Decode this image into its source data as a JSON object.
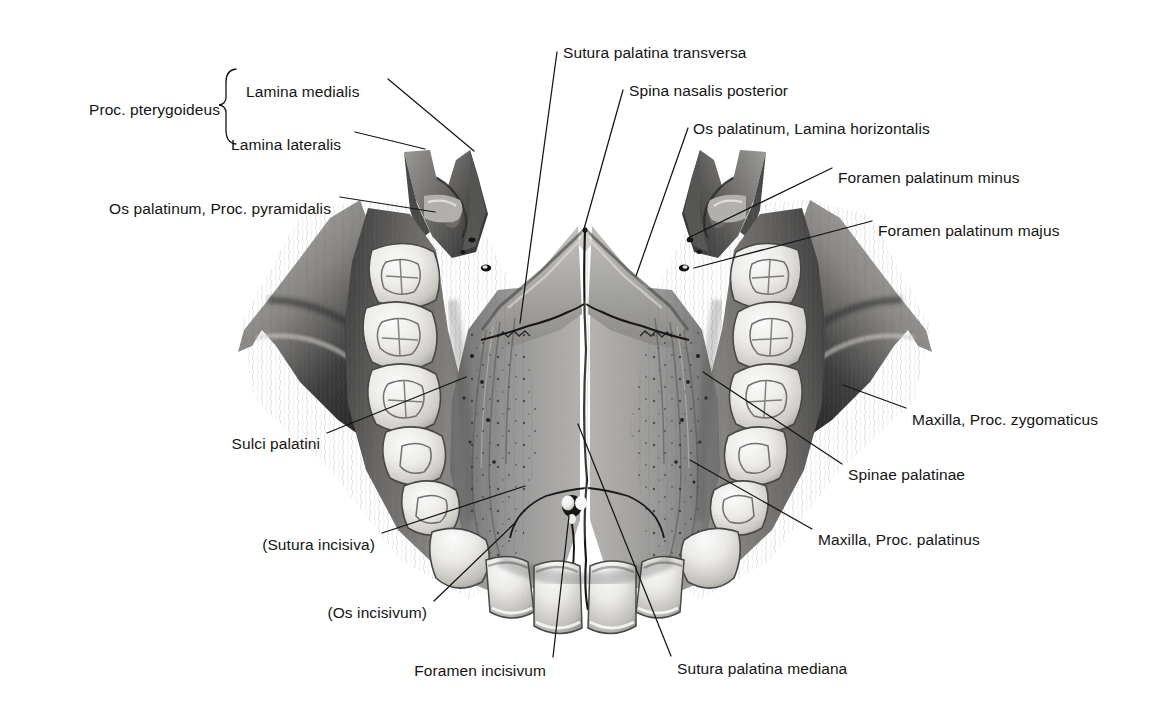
{
  "figure": {
    "kind": "anatomical-illustration",
    "style": "grayscale halftone engraving",
    "background_color": "#ffffff",
    "ink_color": "#141414",
    "width": 1167,
    "height": 712
  },
  "bracket": {
    "label": "Proc. pterygoideus",
    "members": [
      "Lamina medialis",
      "Lamina lateralis"
    ]
  },
  "labels": [
    {
      "id": "proc-pterygoideus",
      "text": "Proc. pterygoideus",
      "x": 220,
      "y": 102,
      "align": "right"
    },
    {
      "id": "lamina-medialis",
      "text": "Lamina medialis",
      "x": 246,
      "y": 84,
      "align": "left"
    },
    {
      "id": "lamina-lateralis",
      "text": "Lamina lateralis",
      "x": 231,
      "y": 137,
      "align": "left"
    },
    {
      "id": "sutura-palatina-transversa",
      "text": "Sutura palatina transversa",
      "x": 563,
      "y": 45,
      "align": "left"
    },
    {
      "id": "spina-nasalis-posterior",
      "text": "Spina nasalis posterior",
      "x": 629,
      "y": 83,
      "align": "left"
    },
    {
      "id": "os-palatinum-lamina-horiz",
      "text": "Os palatinum, Lamina horizontalis",
      "x": 693,
      "y": 121,
      "align": "left"
    },
    {
      "id": "foramen-palatinum-minus",
      "text": "Foramen palatinum minus",
      "x": 838,
      "y": 170,
      "align": "left"
    },
    {
      "id": "foramen-palatinum-majus",
      "text": "Foramen palatinum majus",
      "x": 878,
      "y": 223,
      "align": "left"
    },
    {
      "id": "os-palatinum-proc-pyramidalis",
      "text": "Os palatinum, Proc. pyramidalis",
      "x": 331,
      "y": 201,
      "align": "right"
    },
    {
      "id": "maxilla-proc-zygomaticus",
      "text": "Maxilla, Proc. zygomaticus",
      "x": 912,
      "y": 412,
      "align": "left"
    },
    {
      "id": "spinae-palatinae",
      "text": "Spinae palatinae",
      "x": 848,
      "y": 467,
      "align": "left"
    },
    {
      "id": "maxilla-proc-palatinus",
      "text": "Maxilla, Proc. palatinus",
      "x": 818,
      "y": 532,
      "align": "left"
    },
    {
      "id": "sulci-palatini",
      "text": "Sulci palatini",
      "x": 320,
      "y": 436,
      "align": "right"
    },
    {
      "id": "sutura-incisiva",
      "text": "(Sutura incisiva)",
      "x": 375,
      "y": 537,
      "align": "right"
    },
    {
      "id": "os-incisivum",
      "text": "(Os incisivum)",
      "x": 427,
      "y": 605,
      "align": "right"
    },
    {
      "id": "foramen-incisivum",
      "text": "Foramen incisivum",
      "x": 546,
      "y": 663,
      "align": "right"
    },
    {
      "id": "sutura-palatina-mediana",
      "text": "Sutura palatina mediana",
      "x": 677,
      "y": 661,
      "align": "left"
    }
  ],
  "leader_lines": [
    {
      "id": "leader-lamina-medialis",
      "for": "lamina-medialis",
      "d": "M 388,79 L 474,151"
    },
    {
      "id": "leader-lamina-lateralis",
      "for": "lamina-lateralis",
      "d": "M 355,132 L 425,149"
    },
    {
      "id": "leader-proc-pyramidalis",
      "for": "os-palatinum-proc-pyramidalis",
      "d": "M 340,197 L 435,212"
    },
    {
      "id": "leader-sutura-transversa",
      "for": "sutura-palatina-transversa",
      "d": "M 557,52 L 520,323"
    },
    {
      "id": "leader-spina-nasalis",
      "for": "spina-nasalis-posterior",
      "d": "M 623,90 L 584,229"
    },
    {
      "id": "leader-lamina-horizontalis",
      "for": "os-palatinum-lamina-horiz",
      "d": "M 688,128 L 636,276"
    },
    {
      "id": "leader-foramen-minus",
      "for": "foramen-palatinum-minus",
      "d": "M 832,168 L 688,238"
    },
    {
      "id": "leader-foramen-majus",
      "for": "foramen-palatinum-majus",
      "d": "M 872,221 L 694,268"
    },
    {
      "id": "leader-proc-zygomaticus",
      "for": "maxilla-proc-zygomaticus",
      "d": "M 906,408 L 843,385"
    },
    {
      "id": "leader-spinae-palatinae",
      "for": "spinae-palatinae",
      "d": "M 842,464 L 703,372"
    },
    {
      "id": "leader-proc-palatinus",
      "for": "maxilla-proc-palatinus",
      "d": "M 812,529 L 690,460"
    },
    {
      "id": "leader-sulci-palatini",
      "for": "sulci-palatini",
      "d": "M 327,433 L 466,377"
    },
    {
      "id": "leader-sutura-incisiva",
      "for": "sutura-incisiva",
      "d": "M 382,533 L 525,486"
    },
    {
      "id": "leader-os-incisivum",
      "for": "os-incisivum",
      "d": "M 434,601 L 515,523"
    },
    {
      "id": "leader-foramen-incisivum",
      "for": "foramen-incisivum",
      "d": "M 553,657 L 569,516"
    },
    {
      "id": "leader-sutura-mediana",
      "for": "sutura-palatina-mediana",
      "d": "M 671,656 L 578,424"
    }
  ]
}
